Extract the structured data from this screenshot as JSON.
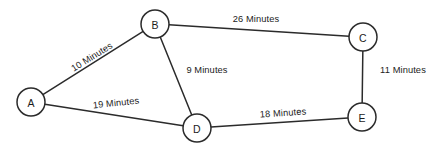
{
  "diagram": {
    "type": "weighted-undirected-graph",
    "unit_word": "Minutes",
    "stroke_color": "#2b2b2b",
    "text_color": "#1c1c1c",
    "background_color": "#ffffff",
    "nodes": [
      {
        "id": "A",
        "label": "A",
        "x": 31,
        "y": 102,
        "r": 14
      },
      {
        "id": "B",
        "label": "B",
        "x": 155,
        "y": 24,
        "r": 14
      },
      {
        "id": "C",
        "label": "C",
        "x": 363,
        "y": 37,
        "r": 14
      },
      {
        "id": "D",
        "label": "D",
        "x": 197,
        "y": 128,
        "r": 14
      },
      {
        "id": "E",
        "label": "E",
        "x": 362,
        "y": 117,
        "r": 14
      }
    ],
    "edges": [
      {
        "id": "AB",
        "from": "A",
        "to": "B",
        "weight": 10,
        "label": "10 Minutes",
        "label_x": 92,
        "label_y": 57,
        "label_rotation": -32
      },
      {
        "id": "BC",
        "from": "B",
        "to": "C",
        "weight": 26,
        "label": "26 Minutes",
        "label_x": 256,
        "label_y": 19,
        "label_rotation": 0
      },
      {
        "id": "BD",
        "from": "B",
        "to": "D",
        "weight": 9,
        "label": "9 Minutes",
        "label_x": 207,
        "label_y": 70,
        "label_rotation": 0
      },
      {
        "id": "AD",
        "from": "A",
        "to": "D",
        "weight": 19,
        "label": "19 Minutes",
        "label_x": 116,
        "label_y": 103,
        "label_rotation": -6
      },
      {
        "id": "DE",
        "from": "D",
        "to": "E",
        "weight": 18,
        "label": "18 Minutes",
        "label_x": 283,
        "label_y": 113,
        "label_rotation": -4
      },
      {
        "id": "CE",
        "from": "C",
        "to": "E",
        "weight": 11,
        "label": "11 Minutes",
        "label_x": 403,
        "label_y": 70,
        "label_rotation": 0
      }
    ]
  }
}
